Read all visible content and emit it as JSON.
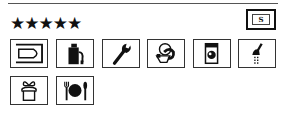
{
  "rating": {
    "stars_text": "★★★★★",
    "star_count": 5
  },
  "badge": {
    "label": "S"
  },
  "facilities": [
    {
      "icon": "boat-slip-icon"
    },
    {
      "icon": "fuel-pump-icon"
    },
    {
      "icon": "wrench-repair-icon"
    },
    {
      "icon": "toilet-icon"
    },
    {
      "icon": "washing-machine-icon"
    },
    {
      "icon": "shower-icon"
    },
    {
      "icon": "shop-provisions-icon"
    },
    {
      "icon": "restaurant-icon"
    }
  ]
}
